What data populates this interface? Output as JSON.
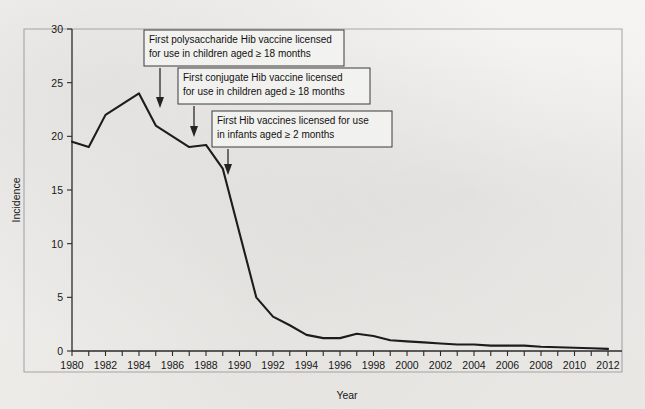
{
  "figure": {
    "background_color": "#f2f1ef",
    "line_color": "#1c1c1c",
    "axis_color": "#2a2a2a"
  },
  "chart_data": {
    "type": "line",
    "title": "",
    "xlabel": "Year",
    "ylabel": "Incidence",
    "xlim": [
      1979,
      2013
    ],
    "ylim": [
      0,
      30
    ],
    "yticks": [
      0,
      5,
      10,
      15,
      20,
      25,
      30
    ],
    "xticks_labeled": [
      1980,
      1982,
      1984,
      1986,
      1988,
      1990,
      1992,
      1994,
      1996,
      1998,
      2000,
      2002,
      2004,
      2006,
      2008,
      2010,
      2012
    ],
    "xtick_minor_every": 1,
    "grid": false,
    "legend": null,
    "x": [
      1980,
      1981,
      1982,
      1983,
      1984,
      1985,
      1986,
      1987,
      1988,
      1989,
      1990,
      1991,
      1992,
      1993,
      1994,
      1995,
      1996,
      1997,
      1998,
      1999,
      2000,
      2001,
      2002,
      2003,
      2004,
      2005,
      2006,
      2007,
      2008,
      2009,
      2010,
      2011,
      2012
    ],
    "values": [
      19.5,
      19.0,
      22.0,
      23.0,
      24.0,
      21.0,
      20.0,
      19.0,
      19.2,
      17.0,
      11.0,
      5.0,
      3.2,
      2.4,
      1.5,
      1.2,
      1.2,
      1.6,
      1.4,
      1.0,
      0.9,
      0.8,
      0.7,
      0.6,
      0.6,
      0.5,
      0.5,
      0.5,
      0.4,
      0.35,
      0.3,
      0.25,
      0.2
    ],
    "series_name": "Incidence",
    "annotations": [
      {
        "id": "anno-polysaccharide",
        "lines": [
          "First polysaccharide Hib vaccine licensed",
          "for use in children aged ≥ 18 months"
        ],
        "points_to_year": 1985,
        "points_to_value": 21.0
      },
      {
        "id": "anno-conjugate",
        "lines": [
          "First conjugate Hib vaccine licensed",
          "for use in children aged ≥ 18 months"
        ],
        "points_to_year": 1987,
        "points_to_value": 19.0
      },
      {
        "id": "anno-infants",
        "lines": [
          "First Hib vaccines licensed for use",
          "in infants aged ≥ 2 months"
        ],
        "points_to_year": 1989,
        "points_to_value": 17.0
      }
    ]
  },
  "axes": {
    "y_label": "Incidence",
    "x_label": "Year",
    "y_tick_labels": [
      "0",
      "5",
      "10",
      "15",
      "20",
      "25",
      "30"
    ],
    "x_tick_labels": [
      "1980",
      "1982",
      "1984",
      "1986",
      "1988",
      "1990",
      "1992",
      "1994",
      "1996",
      "1998",
      "2000",
      "2002",
      "2004",
      "2006",
      "2008",
      "2010",
      "2012"
    ]
  },
  "annotation_text": {
    "box1_line1": "First polysaccharide Hib vaccine licensed",
    "box1_line2": "for use in children aged ≥ 18 months",
    "box2_line1": "First conjugate Hib vaccine licensed",
    "box2_line2": "for use in children aged ≥ 18 months",
    "box3_line1": "First Hib vaccines licensed for use",
    "box3_line2": "in infants aged ≥ 2 months"
  }
}
